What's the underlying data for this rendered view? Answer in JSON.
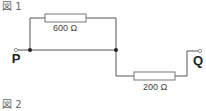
{
  "figures": [
    {
      "label": "図 1"
    },
    {
      "label": "図 2"
    }
  ],
  "circuit": {
    "terminals": [
      {
        "id": "P",
        "label": "P"
      },
      {
        "id": "Q",
        "label": "Q"
      }
    ],
    "resistors": [
      {
        "id": "R1",
        "value_label": "600 Ω",
        "position": "top-parallel-branch"
      },
      {
        "id": "R2",
        "value_label": "200 Ω",
        "position": "bottom-series"
      }
    ],
    "colors": {
      "wire": "#555555",
      "resistor_fill": "#ffffff",
      "resistor_stroke": "#777777",
      "node": "#222222"
    }
  }
}
